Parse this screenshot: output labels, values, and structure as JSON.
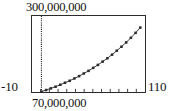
{
  "chart_data": {
    "type": "scatter",
    "title": "",
    "subtitle": "",
    "xlabel": "",
    "ylabel": "",
    "xlim": [
      -10,
      110
    ],
    "ylim": [
      70000000,
      300000000
    ],
    "xtick_labels": [
      "-10",
      "110"
    ],
    "ytick_labels": [
      "70,000,000",
      "300,000,000"
    ],
    "grid": false,
    "legend": "none",
    "axis_tick_count_x": 12,
    "marker": "square",
    "annotations": [
      {
        "name": "vertical-dotted-line",
        "x": 0,
        "style": "dotted"
      }
    ],
    "series": [
      {
        "name": "data",
        "marker": "square",
        "line": "solid",
        "x": [
          0,
          5,
          10,
          15,
          20,
          25,
          30,
          35,
          40,
          45,
          50,
          55,
          60,
          65,
          70,
          75,
          80,
          85,
          90,
          95,
          100,
          105
        ],
        "y": [
          71000000,
          76000000,
          81000000,
          86000000,
          92000000,
          98000000,
          104000000,
          111000000,
          118000000,
          126000000,
          134000000,
          143000000,
          152000000,
          162000000,
          172000000,
          183000000,
          195000000,
          207000000,
          220000000,
          234000000,
          249000000,
          265000000
        ]
      }
    ]
  },
  "labels": {
    "y_max": "300,000,000",
    "y_min": "70,000,000",
    "x_min": "-10",
    "x_max": "110"
  },
  "colors": {
    "frame": "#2b2b2b",
    "curve": "#3a3a3a",
    "marker": "#2b2b2b",
    "dotted": "#1a1a1a",
    "background": "#ffffff",
    "text": "#111111"
  }
}
